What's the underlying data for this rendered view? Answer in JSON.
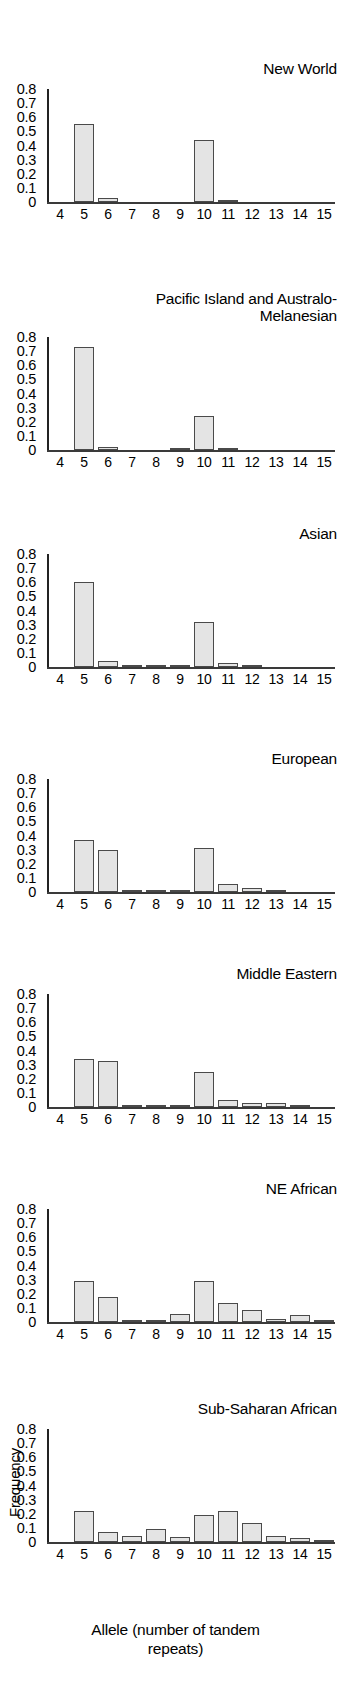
{
  "figure": {
    "xlabel": "Allele (number of tandem\nrepeats)",
    "ylabel": "Frequency",
    "yticks": [
      "0.8",
      "0.7",
      "0.6",
      "0.5",
      "0.4",
      "0.3",
      "0.2",
      "0.1",
      "0"
    ],
    "xticks": [
      "4",
      "5",
      "6",
      "7",
      "8",
      "9",
      "10",
      "11",
      "12",
      "13",
      "14",
      "15"
    ],
    "bar_fill": "#e4e4e4",
    "bar_edge": "#4a4a4a",
    "axis_color": "#232323"
  },
  "chart_data": {
    "type": "bar",
    "xlabel": "Allele (number of tandem repeats)",
    "ylabel": "Frequency",
    "categories": [
      4,
      5,
      6,
      7,
      8,
      9,
      10,
      11,
      12,
      13,
      14,
      15
    ],
    "xlim": [
      3.5,
      15.5
    ],
    "ylim": [
      0,
      0.85
    ],
    "yticks": [
      0,
      0.1,
      0.2,
      0.3,
      0.4,
      0.5,
      0.6,
      0.7,
      0.8
    ],
    "grid": false,
    "legend": "none",
    "panel_layout": "7 stacked panels, shared x axis 4-15, shared y axis 0-0.8",
    "panels": [
      {
        "label": "New World",
        "values": [
          0,
          0.555,
          0.025,
          0,
          0,
          0,
          0.44,
          0.005,
          0,
          0,
          0,
          0
        ]
      },
      {
        "label": "Pacific Island and Australo-Melanesian",
        "values": [
          0,
          0.73,
          0.02,
          0,
          0,
          0.01,
          0.24,
          0.015,
          0,
          0,
          0,
          0
        ]
      },
      {
        "label": "Asian",
        "values": [
          0,
          0.6,
          0.045,
          0.005,
          0.003,
          0.003,
          0.32,
          0.03,
          0.008,
          0,
          0,
          0
        ]
      },
      {
        "label": "European",
        "values": [
          0,
          0.37,
          0.3,
          0.01,
          0.003,
          0.015,
          0.31,
          0.06,
          0.025,
          0.003,
          0,
          0
        ]
      },
      {
        "label": "Middle Eastern",
        "values": [
          0,
          0.34,
          0.325,
          0.005,
          0.012,
          0.012,
          0.25,
          0.05,
          0.03,
          0.03,
          0.005,
          0
        ]
      },
      {
        "label": "NE African",
        "values": [
          0,
          0.29,
          0.175,
          0.015,
          0.005,
          0.055,
          0.29,
          0.135,
          0.085,
          0.018,
          0.05,
          0.005
        ]
      },
      {
        "label": "Sub-Saharan African",
        "values": [
          0,
          0.22,
          0.07,
          0.04,
          0.09,
          0.035,
          0.19,
          0.22,
          0.135,
          0.04,
          0.03,
          0.005
        ]
      }
    ]
  }
}
